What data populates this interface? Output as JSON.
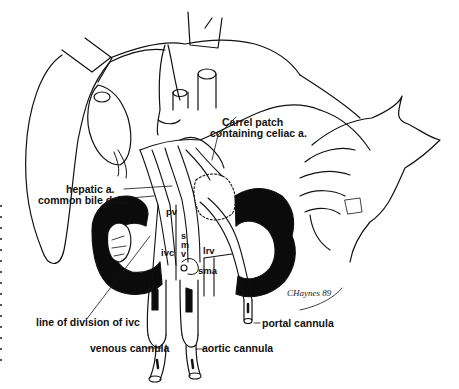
{
  "figure": {
    "type": "surgical line illustration",
    "signature": "CHaynes 89",
    "labels": {
      "carrel_patch_line1": "Carrel patch",
      "carrel_patch_line2": "containing celiac a.",
      "hepatic_artery": "hepatic a.",
      "common_bile_duct": "common bile duct",
      "pv": "pv",
      "ivc": "ivc",
      "smv_s": "s",
      "smv_m": "m",
      "smv_v": "v",
      "lrv": "lrv",
      "sma": "sma",
      "line_of_division": "line of division of ivc",
      "portal_cannula": "portal cannula",
      "venous_cannula": "venous cannula",
      "aortic_cannula": "aortic cannula"
    }
  }
}
